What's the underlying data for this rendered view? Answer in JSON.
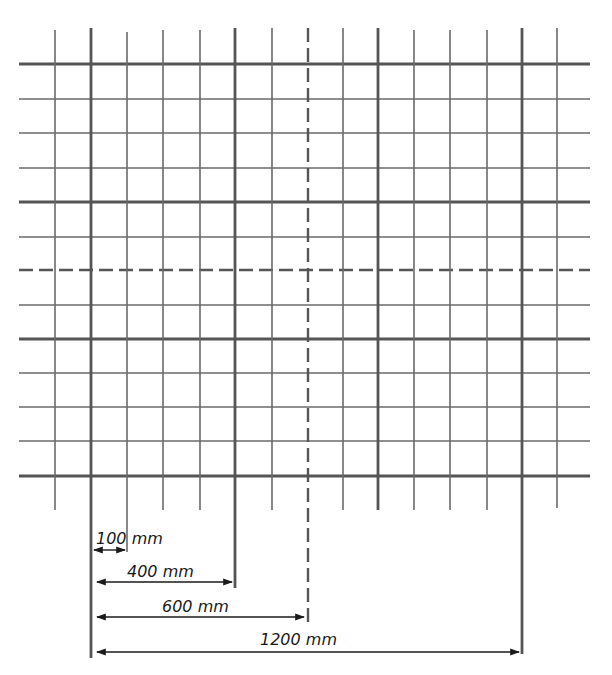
{
  "diagram": {
    "type": "stud-grid-layout",
    "colors": {
      "line": "#6a6a6a",
      "thick": "#555555",
      "text": "#1a1a1a",
      "background": "#ffffff"
    },
    "vertical_lines": [
      {
        "x": 55,
        "y1": 30,
        "y2": 510,
        "style": "thin"
      },
      {
        "x": 91,
        "y1": 28,
        "y2": 658,
        "style": "thick"
      },
      {
        "x": 127,
        "y1": 32,
        "y2": 552,
        "style": "thin"
      },
      {
        "x": 163,
        "y1": 30,
        "y2": 510,
        "style": "thin"
      },
      {
        "x": 200,
        "y1": 30,
        "y2": 510,
        "style": "thin"
      },
      {
        "x": 235,
        "y1": 28,
        "y2": 588,
        "style": "thick"
      },
      {
        "x": 272,
        "y1": 28,
        "y2": 510,
        "style": "thin"
      },
      {
        "x": 308,
        "y1": 28,
        "y2": 622,
        "style": "dashed"
      },
      {
        "x": 343,
        "y1": 28,
        "y2": 510,
        "style": "thin"
      },
      {
        "x": 378,
        "y1": 28,
        "y2": 510,
        "style": "thick"
      },
      {
        "x": 414,
        "y1": 30,
        "y2": 510,
        "style": "thin"
      },
      {
        "x": 450,
        "y1": 30,
        "y2": 510,
        "style": "thin"
      },
      {
        "x": 487,
        "y1": 30,
        "y2": 510,
        "style": "thin"
      },
      {
        "x": 522,
        "y1": 28,
        "y2": 654,
        "style": "thick"
      },
      {
        "x": 557,
        "y1": 28,
        "y2": 508,
        "style": "thin"
      }
    ],
    "horizontal_lines": [
      {
        "y": 64,
        "style": "thick"
      },
      {
        "y": 99,
        "style": "thin"
      },
      {
        "y": 133,
        "style": "thin"
      },
      {
        "y": 168,
        "style": "thin"
      },
      {
        "y": 202,
        "style": "thick"
      },
      {
        "y": 237,
        "style": "thin"
      },
      {
        "y": 270,
        "style": "dashed"
      },
      {
        "y": 305,
        "style": "thin"
      },
      {
        "y": 339,
        "style": "thick"
      },
      {
        "y": 373,
        "style": "thin"
      },
      {
        "y": 407,
        "style": "thin"
      },
      {
        "y": 441,
        "style": "thin"
      },
      {
        "y": 476,
        "style": "thick"
      }
    ],
    "grid_x_start": 19,
    "grid_x_end": 590,
    "dimensions": [
      {
        "label": "100 mm",
        "x1": 94,
        "x2": 125,
        "y": 550,
        "label_x": 96,
        "label_y": 544
      },
      {
        "label": "400 mm",
        "x1": 97,
        "x2": 232,
        "y": 582,
        "label_x": 127,
        "label_y": 577
      },
      {
        "label": "600 mm",
        "x1": 97,
        "x2": 304,
        "y": 617,
        "label_x": 162,
        "label_y": 612
      },
      {
        "label": "1200 mm",
        "x1": 97,
        "x2": 519,
        "y": 652,
        "label_x": 260,
        "label_y": 645
      }
    ]
  }
}
